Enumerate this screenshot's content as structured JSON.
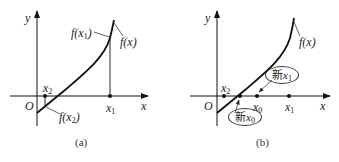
{
  "panels": [
    {
      "id": "a",
      "caption": "(a)",
      "axes": {
        "x": "x",
        "y": "y",
        "origin": "O"
      },
      "labels": {
        "curve": "f(x)",
        "fx1": "f(x1)",
        "fx2": "f(x2)",
        "x1": "x1",
        "x2": "x2"
      }
    },
    {
      "id": "b",
      "caption": "(b)",
      "axes": {
        "x": "x",
        "y": "y",
        "origin": "O"
      },
      "labels": {
        "curve": "f(x)",
        "x0": "x0",
        "x1": "x1",
        "x2": "x2",
        "new_x1": "新x1",
        "new_x0": "新x0"
      }
    }
  ],
  "text": {
    "a_y": "y",
    "a_x": "x",
    "a_O": "O",
    "a_f": "f",
    "a_x_var": "x",
    "a_caption": "(a)",
    "b_y": "y",
    "b_x": "x",
    "b_O": "O",
    "b_caption": "(b)",
    "new_char": "新",
    "f": "f",
    "xv": "x",
    "paren_open": "(",
    "paren_close": ")",
    "s0": "0",
    "s1": "1",
    "s2": "2"
  }
}
